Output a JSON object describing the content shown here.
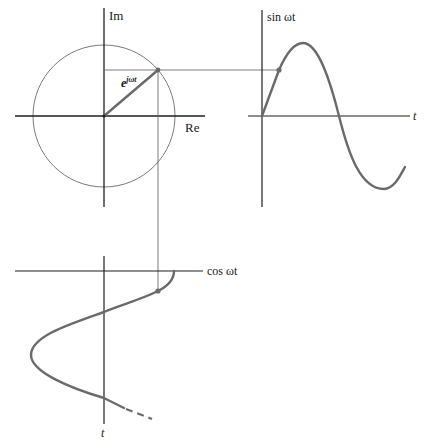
{
  "diagram": {
    "colors": {
      "axis": "#1f1f1f",
      "thin_line": "#6e6e6e",
      "curve": "#6a6a6a",
      "background": "#ffffff"
    },
    "phasor_plane": {
      "imag_axis_label": "Im",
      "real_axis_label": "Re",
      "phasor_label_base": "e",
      "phasor_label_exponent": "jωt",
      "center": [
        104,
        116
      ],
      "radius": 72
    },
    "sine_plot": {
      "y_label": "sin ωt",
      "x_label": "t"
    },
    "cosine_plot": {
      "x_label": "cos ωt",
      "y_label": "t"
    }
  }
}
